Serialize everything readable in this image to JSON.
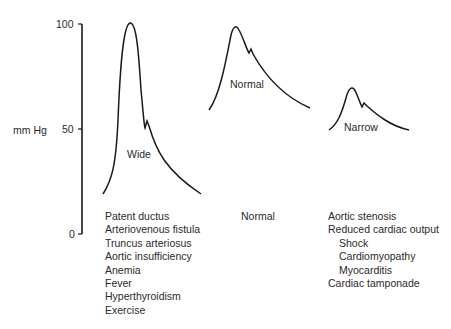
{
  "axis": {
    "label": "mm Hg",
    "ticks": [
      {
        "value": "100",
        "y": 24
      },
      {
        "value": "50",
        "y": 129
      },
      {
        "value": "0",
        "y": 234
      }
    ]
  },
  "waveforms": [
    {
      "label": "Wide",
      "path": "M103,194 C112,180 116,165 118,120 C120,70 123,25 130,23 C137,22 139,60 141,90 C143,110 144,125 145,128 L147,121 L149,126 C156,150 165,170 201,194",
      "conditions": [
        {
          "text": "Patent ductus",
          "indent": false
        },
        {
          "text": "Arteriovenous fistula",
          "indent": false
        },
        {
          "text": "Truncus arteriosus",
          "indent": false
        },
        {
          "text": "Aortic insufficiency",
          "indent": false
        },
        {
          "text": "Anemia",
          "indent": false
        },
        {
          "text": "Fever",
          "indent": false
        },
        {
          "text": "Hyperthyroidism",
          "indent": false
        },
        {
          "text": "Exercise",
          "indent": false
        }
      ]
    },
    {
      "label": "Normal",
      "path": "M209,110 C220,95 226,60 231,35 C233,27 236,24 239,30 C243,37 246,48 249,53 L251,49 L253,54 C262,70 280,95 310,108",
      "conditions": [
        {
          "text": "Normal",
          "indent": false
        }
      ]
    },
    {
      "label": "Narrow",
      "path": "M329,130 C338,124 342,112 346,98 C348,90 351,86 354,89 C357,93 359,101 362,107 L364,103 L367,106 C376,114 390,126 409,130",
      "conditions": [
        {
          "text": "Aortic stenosis",
          "indent": false
        },
        {
          "text": "Reduced cardiac output",
          "indent": false
        },
        {
          "text": "Shock",
          "indent": true
        },
        {
          "text": "Cardiomyopathy",
          "indent": true
        },
        {
          "text": "Myocarditis",
          "indent": true
        },
        {
          "text": "Cardiac tamponade",
          "indent": false
        }
      ]
    }
  ],
  "colors": {
    "line": "#1a1a1a",
    "text": "#2a2a2a"
  }
}
